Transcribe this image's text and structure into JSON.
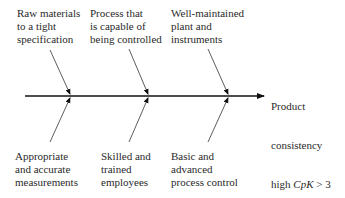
{
  "diagram": {
    "type": "fishbone",
    "effect": {
      "lines": [
        "Product",
        "consistency"
      ],
      "last_line_prefix": "high ",
      "metric": "CpK",
      "condition": " > 3"
    },
    "causes_top": [
      {
        "lines": "Raw materials\nto a tight\nspecification"
      },
      {
        "lines": "Process that\nis capable of\nbeing controlled"
      },
      {
        "lines": "Well-maintained\nplant and\ninstruments"
      }
    ],
    "causes_bottom": [
      {
        "lines": "Appropriate\nand accurate\nmeasurements"
      },
      {
        "lines": "Skilled and\ntrained\nemployees"
      },
      {
        "lines": "Basic and\nadvanced\nprocess control"
      }
    ]
  }
}
